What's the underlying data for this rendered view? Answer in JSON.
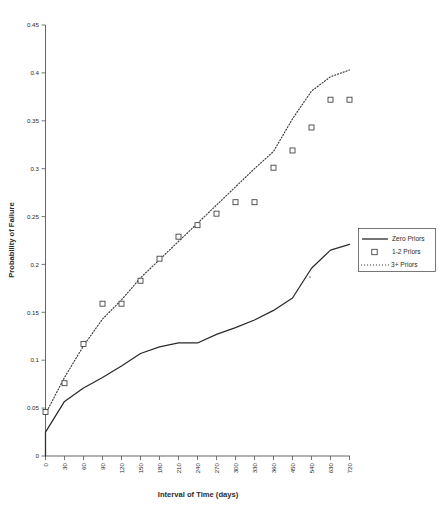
{
  "chart_data": {
    "type": "line",
    "title": "",
    "xlabel": "Interval of Time (days)",
    "ylabel": "Probability of Failure",
    "grid": false,
    "legend_position": "right",
    "categories": [
      0,
      30,
      60,
      90,
      120,
      150,
      180,
      210,
      240,
      270,
      300,
      330,
      360,
      450,
      540,
      630,
      720
    ],
    "tick_labels_x": [
      "0",
      "30",
      "60",
      "90",
      "120",
      "150",
      "180",
      "210",
      "240",
      "270",
      "300",
      "330",
      "360",
      "450",
      "540",
      "630",
      "720"
    ],
    "tick_labels_y": [
      "0",
      "0.05",
      "0.1",
      "0.15",
      "0.2",
      "0.25",
      "0.3",
      "0.35",
      "0.4",
      "0.45"
    ],
    "ylim": [
      0,
      0.45
    ],
    "ytick_step": 0.05,
    "series": [
      {
        "name": "Zero Priors",
        "style": "solid-line",
        "values": [
          0.025,
          0.057,
          0.071,
          0.082,
          0.094,
          0.107,
          0.114,
          0.118,
          0.118,
          0.127,
          0.134,
          0.142,
          0.152,
          0.165,
          0.196,
          0.215,
          0.221
        ]
      },
      {
        "name": "1-2 Priors",
        "style": "square-markers",
        "values": [
          0.046,
          0.076,
          0.117,
          0.159,
          0.159,
          0.183,
          0.206,
          0.229,
          0.241,
          0.253,
          0.265,
          0.265,
          0.301,
          0.319,
          0.343,
          0.372,
          0.372
        ]
      },
      {
        "name": "3+ Priors",
        "style": "dotted-line",
        "values": [
          0.044,
          0.082,
          0.115,
          0.143,
          0.163,
          0.186,
          0.205,
          0.224,
          0.243,
          0.262,
          0.281,
          0.3,
          0.318,
          0.352,
          0.381,
          0.396,
          0.403
        ]
      }
    ]
  },
  "legend": {
    "entries": [
      {
        "label": "Zero Priors",
        "marker": "line-solid"
      },
      {
        "label": "1-2 Priors",
        "marker": "square"
      },
      {
        "label": "3+ Priors",
        "marker": "line-dotted"
      }
    ]
  },
  "colors": {
    "series_line": "#2a2a2a",
    "series_dotted": "#3a3a3a",
    "marker_stroke": "#3a3a3a",
    "axis": "#555555",
    "background": "#ffffff",
    "text": "#2b2b2b"
  }
}
